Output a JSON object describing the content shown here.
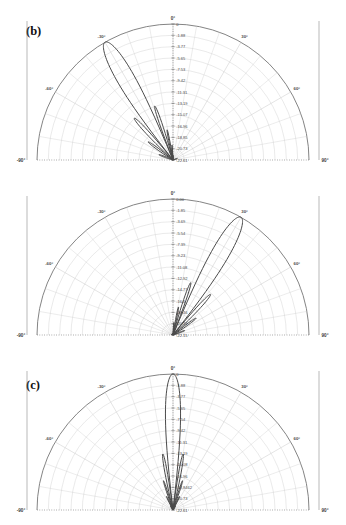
{
  "figure": {
    "panel_count": 3,
    "background_color": "#ffffff",
    "curve_color": "#4a4a4a",
    "grid_color": "#c9c9c9",
    "axis_color": "#6e6e6e"
  },
  "panels": [
    {
      "tag": "(b)",
      "chart_data": {
        "type": "line",
        "plot_style": "polar-half-plane",
        "title": "(b)",
        "xlabel": "",
        "ylabel": "",
        "grid": true,
        "legend": null,
        "angular_unit": "degrees",
        "angular_range": [
          -90,
          90
        ],
        "angular_ticks": [
          -90,
          -60,
          -30,
          0,
          30,
          60,
          90
        ],
        "angular_tick_labels": [
          "-90°",
          "-60°",
          "-30°",
          "0°",
          "30°",
          "60°",
          "90°"
        ],
        "radial_unit": "dB",
        "radial_outer_value": 0,
        "radial_tick_labels": [
          "0",
          "-1.88",
          "-3.77",
          "-5.65",
          "-7.53",
          "-9.42",
          "-11.31",
          "-13.19",
          "-15.07",
          "-16.96",
          "-18.85",
          "-20.73",
          "-22.61"
        ],
        "radial_tick_values": [
          0,
          -1.88,
          -3.77,
          -5.65,
          -7.53,
          -9.42,
          -11.31,
          -13.19,
          -15.07,
          -16.96,
          -18.85,
          -20.73,
          -22.61
        ],
        "radial_min": -22.61,
        "radial_max": 0,
        "series": [
          {
            "name": "pattern-b",
            "peak_angle_deg": -30,
            "peak_value_db": 0,
            "description": "main beam steered to -30 degrees with narrow sidelobe near 0 degrees"
          }
        ]
      }
    },
    {
      "tag": "(c)",
      "chart_data": {
        "type": "line",
        "plot_style": "polar-half-plane",
        "title": "(c)",
        "xlabel": "",
        "ylabel": "",
        "grid": true,
        "legend": null,
        "angular_unit": "degrees",
        "angular_range": [
          -90,
          90
        ],
        "angular_ticks": [
          -90,
          -60,
          -30,
          0,
          30,
          60,
          90
        ],
        "angular_tick_labels": [
          "-90°",
          "-60°",
          "-30°",
          "0°",
          "30°",
          "60°",
          "90°"
        ],
        "radial_unit": "dB",
        "radial_outer_value": 0,
        "radial_tick_labels": [
          "0.00",
          "-1.85",
          "-3.69",
          "-5.54",
          "-7.39",
          "-9.23",
          "-11.08",
          "-12.92",
          "-14.77",
          "-16.6",
          "-18.46",
          "-20.31",
          "-22.15"
        ],
        "radial_tick_values": [
          0.0,
          -1.85,
          -3.69,
          -5.54,
          -7.39,
          -9.23,
          -11.08,
          -12.92,
          -14.77,
          -16.6,
          -18.46,
          -20.31,
          -22.15
        ],
        "radial_min": -22.15,
        "radial_max": 0,
        "series": [
          {
            "name": "pattern-c",
            "peak_angle_deg": 30,
            "peak_value_db": 0,
            "description": "main beam steered to +30 degrees with sidelobes near -90 and 0 degrees"
          }
        ]
      }
    },
    {
      "tag": "(d)",
      "chart_data": {
        "type": "line",
        "plot_style": "polar-half-plane",
        "title": "(d)",
        "xlabel": "",
        "ylabel": "",
        "grid": true,
        "legend": null,
        "angular_unit": "degrees",
        "angular_range": [
          -90,
          90
        ],
        "angular_ticks": [
          -90,
          -60,
          -30,
          0,
          30,
          60,
          90
        ],
        "angular_tick_labels": [
          "-90°",
          "-60°",
          "-30°",
          "0°",
          "30°",
          "60°",
          "90°"
        ],
        "radial_unit": "dB",
        "radial_outer_value": 0,
        "radial_tick_labels": [
          "0",
          "-1.88",
          "-3.77",
          "-5.65",
          "-7.54",
          "-9.42",
          "-11.31",
          "-13.19",
          "-15.08",
          "-16.96",
          "-18.8462",
          "-20.73",
          "-22.61"
        ],
        "radial_tick_values": [
          0,
          -1.88,
          -3.77,
          -5.65,
          -7.54,
          -9.42,
          -11.31,
          -13.19,
          -15.08,
          -16.96,
          -18.8462,
          -20.73,
          -22.61
        ],
        "radial_min": -22.61,
        "radial_max": 0,
        "series": [
          {
            "name": "pattern-d",
            "peak_angle_deg": 0,
            "peak_value_db": 0,
            "description": "broadside main beam at 0 degrees, narrow and tall"
          }
        ]
      }
    }
  ]
}
